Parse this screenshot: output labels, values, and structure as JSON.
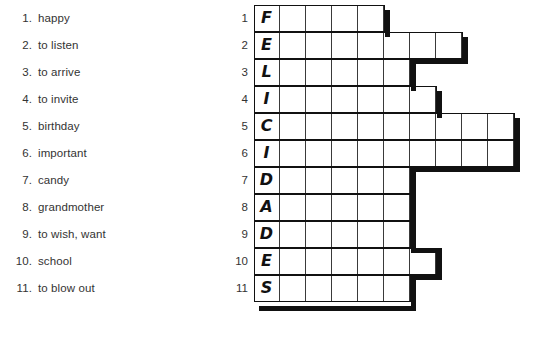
{
  "worksheet": {
    "title": "Felicidades crossword worksheet",
    "ink_color": "#111111",
    "grid_line_color": "#3a3a3a",
    "paper_color": "#ffffff"
  },
  "clues": [
    {
      "number": "1.",
      "text": "happy"
    },
    {
      "number": "2.",
      "text": "to listen"
    },
    {
      "number": "3.",
      "text": "to arrive"
    },
    {
      "number": "4.",
      "text": "to invite"
    },
    {
      "number": "5.",
      "text": "birthday"
    },
    {
      "number": "6.",
      "text": "important"
    },
    {
      "number": "7.",
      "text": "candy"
    },
    {
      "number": "8.",
      "text": "grandmother"
    },
    {
      "number": "9.",
      "text": "to wish, want"
    },
    {
      "number": "10.",
      "text": "school"
    },
    {
      "number": "11.",
      "text": "to blow out"
    }
  ],
  "grid": {
    "row_numbers": [
      "1",
      "2",
      "3",
      "4",
      "5",
      "6",
      "7",
      "8",
      "9",
      "10",
      "11"
    ],
    "key_word": "FELICIDADES",
    "rows": [
      {
        "number": "1",
        "letter": "F",
        "cells": 5
      },
      {
        "number": "2",
        "letter": "E",
        "cells": 8
      },
      {
        "number": "3",
        "letter": "L",
        "cells": 6
      },
      {
        "number": "4",
        "letter": "I",
        "cells": 7
      },
      {
        "number": "5",
        "letter": "C",
        "cells": 10
      },
      {
        "number": "6",
        "letter": "I",
        "cells": 10
      },
      {
        "number": "7",
        "letter": "D",
        "cells": 6
      },
      {
        "number": "8",
        "letter": "A",
        "cells": 6
      },
      {
        "number": "9",
        "letter": "D",
        "cells": 6
      },
      {
        "number": "10",
        "letter": "E",
        "cells": 7
      },
      {
        "number": "11",
        "letter": "S",
        "cells": 6
      }
    ]
  }
}
